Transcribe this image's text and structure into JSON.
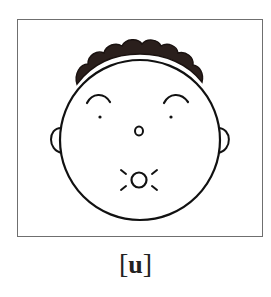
{
  "figure": {
    "caption": {
      "open_bracket": "[",
      "phoneme": "u",
      "close_bracket": "]"
    },
    "colors": {
      "frame": "#6f6f6f",
      "line": "#111111",
      "hair": "#2a1f1c",
      "background": "#ffffff"
    }
  }
}
